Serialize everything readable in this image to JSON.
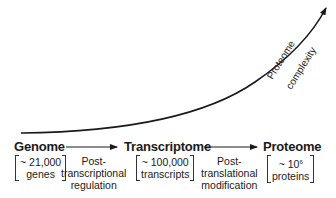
{
  "diagram": {
    "stages": [
      {
        "name": "Genome",
        "count": "~ 21,000",
        "unit": "genes"
      },
      {
        "name": "Transcriptome",
        "count": "~ 100,000",
        "unit": "transcripts"
      },
      {
        "name": "Proteome",
        "count_prefix": "~ 10",
        "count_exponent": "6",
        "unit": "proteins"
      }
    ],
    "processes": [
      {
        "line1": "Post-",
        "line2": "transcriptional",
        "line3": "regulation"
      },
      {
        "line1": "Post-",
        "line2": "translational",
        "line3": "modification"
      }
    ],
    "curve_label": {
      "line1": "Proteome",
      "line2": "complexity"
    },
    "colors": {
      "line": "#1a1a1a",
      "text": "#1a1a1a",
      "background": "#ffffff"
    }
  }
}
